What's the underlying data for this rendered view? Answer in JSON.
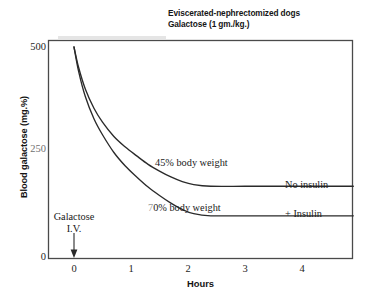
{
  "chart_data": {
    "type": "line",
    "title": "Eviscerated-nephrectomized dogs Galactose (1 gm./kg.)",
    "title_lines": [
      "Eviscerated-nephrectomized dogs",
      "Galactose (1 gm./kg.)"
    ],
    "xlabel": "Hours",
    "ylabel": "Blood galactose (mg.%)",
    "xlim": [
      -0.45,
      4.9
    ],
    "ylim": [
      0,
      545
    ],
    "xticks": [
      "0",
      "1",
      "2",
      "3",
      "4"
    ],
    "xtick_values": [
      0,
      1,
      2,
      3,
      4
    ],
    "yticks": [
      "0",
      "250",
      "500"
    ],
    "ytick_values": [
      0,
      250,
      500
    ],
    "grid": false,
    "legend": "inline-annotations",
    "series": [
      {
        "name": "45% body weight",
        "end_label": "No insulin",
        "plateau": 170,
        "x": [
          0,
          0.08,
          0.2,
          0.35,
          0.5,
          0.7,
          0.9,
          1.1,
          1.3,
          1.5,
          1.7,
          1.9,
          2.1,
          2.4,
          3.0,
          3.6,
          4.2,
          4.9
        ],
        "y": [
          500,
          452,
          400,
          355,
          322,
          288,
          263,
          242,
          222,
          206,
          192,
          181,
          174,
          170,
          170,
          170,
          170,
          170
        ]
      },
      {
        "name": "70% body weight",
        "end_label": "+ Insulin",
        "plateau": 100,
        "x": [
          0,
          0.08,
          0.2,
          0.35,
          0.5,
          0.7,
          0.9,
          1.1,
          1.3,
          1.5,
          1.7,
          1.9,
          2.1,
          2.4,
          3.0,
          3.6,
          4.2,
          4.9
        ],
        "y": [
          500,
          443,
          382,
          330,
          292,
          250,
          218,
          192,
          168,
          148,
          130,
          115,
          105,
          100,
          100,
          100,
          100,
          100
        ]
      }
    ],
    "annotations": [
      {
        "name": "injection-marker",
        "text_lines": [
          "Galactose",
          "I.V."
        ],
        "x": 0,
        "arrow": "down-to-axis"
      }
    ],
    "colors": {
      "curve": "#2a2a2a",
      "frame": "#4a4a4a",
      "text": "#1a1a1a",
      "background": "#ffffff"
    }
  },
  "figure": {
    "title_line_1": "Eviscerated-nephrectomized dogs",
    "title_line_2": "Galactose (1 gm./kg.)",
    "y_axis_title": "Blood galactose (mg.%)",
    "x_axis_title": "Hours",
    "y_ticks": [
      "500",
      "250",
      "0"
    ],
    "x_ticks": [
      "0",
      "1",
      "2",
      "3",
      "4"
    ],
    "annotation_upper_curve": "45% body weight",
    "annotation_lower_curve_prefix": "7",
    "annotation_lower_curve_rest": "0% body weight",
    "annotation_upper_end": "No insulin",
    "annotation_lower_end": "+ Insulin",
    "injection_line_1": "Galactose",
    "injection_line_2": "I.V."
  }
}
